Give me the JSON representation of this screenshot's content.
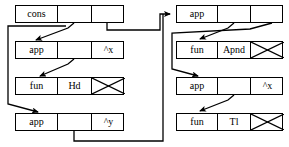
{
  "diagram": {
    "type": "box-and-pointer-graph",
    "background_color": "#ffffff",
    "line_color": "#000000",
    "nodes": [
      {
        "id": "cons-node",
        "name": "cons-node",
        "x": 15,
        "y": 5,
        "width": 109,
        "height": 18,
        "cells": [
          {
            "name": "cons-tag-cell",
            "label": "cons",
            "width": 42,
            "kind": "text"
          },
          {
            "name": "cons-left-pointer-cell",
            "label": "",
            "width": 34,
            "kind": "pointer"
          },
          {
            "name": "cons-right-pointer-cell",
            "label": "",
            "width": 33,
            "kind": "pointer"
          }
        ]
      },
      {
        "id": "app-x-node",
        "name": "app-hd-node",
        "x": 15,
        "y": 41,
        "width": 109,
        "height": 18,
        "cells": [
          {
            "name": "app-tag-cell",
            "label": "app",
            "width": 42,
            "kind": "text"
          },
          {
            "name": "app-function-pointer-cell",
            "label": "",
            "width": 34,
            "kind": "pointer"
          },
          {
            "name": "app-argument-cell",
            "label": "^x",
            "width": 33,
            "kind": "variable"
          }
        ]
      },
      {
        "id": "fun-hd-node",
        "name": "fun-hd-node",
        "x": 15,
        "y": 77,
        "width": 109,
        "height": 18,
        "cells": [
          {
            "name": "fun-tag-cell",
            "label": "fun",
            "width": 42,
            "kind": "text"
          },
          {
            "name": "fun-name-cell",
            "label": "Hd",
            "width": 34,
            "kind": "text"
          },
          {
            "name": "fun-nil-cell",
            "label": "",
            "width": 33,
            "kind": "nil"
          }
        ]
      },
      {
        "id": "app-y-node",
        "name": "app-tl-node",
        "x": 15,
        "y": 113,
        "width": 109,
        "height": 18,
        "cells": [
          {
            "name": "app-tag-cell",
            "label": "app",
            "width": 42,
            "kind": "text"
          },
          {
            "name": "app-function-pointer-cell",
            "label": "",
            "width": 34,
            "kind": "pointer"
          },
          {
            "name": "app-argument-cell",
            "label": "^y",
            "width": 33,
            "kind": "variable"
          }
        ]
      },
      {
        "id": "app-apnd-node",
        "name": "app-apnd-node",
        "x": 176,
        "y": 5,
        "width": 107,
        "height": 18,
        "cells": [
          {
            "name": "app-tag-cell",
            "label": "app",
            "width": 41,
            "kind": "text"
          },
          {
            "name": "app-function-pointer-cell",
            "label": "",
            "width": 33,
            "kind": "pointer"
          },
          {
            "name": "app-argument-pointer-cell",
            "label": "",
            "width": 33,
            "kind": "pointer"
          }
        ]
      },
      {
        "id": "fun-apnd-node",
        "name": "fun-apnd-node",
        "x": 176,
        "y": 41,
        "width": 107,
        "height": 18,
        "cells": [
          {
            "name": "fun-tag-cell",
            "label": "fun",
            "width": 41,
            "kind": "text"
          },
          {
            "name": "fun-name-cell",
            "label": "Apnd",
            "width": 33,
            "kind": "text"
          },
          {
            "name": "fun-nil-cell",
            "label": "",
            "width": 33,
            "kind": "nil"
          }
        ]
      },
      {
        "id": "app-x-right-node",
        "name": "app-tl-right-node",
        "x": 176,
        "y": 77,
        "width": 107,
        "height": 18,
        "cells": [
          {
            "name": "app-tag-cell",
            "label": "app",
            "width": 41,
            "kind": "text"
          },
          {
            "name": "app-function-pointer-cell",
            "label": "",
            "width": 33,
            "kind": "pointer"
          },
          {
            "name": "app-argument-cell",
            "label": "^x",
            "width": 33,
            "kind": "variable"
          }
        ]
      },
      {
        "id": "fun-tl-node",
        "name": "fun-tl-node",
        "x": 176,
        "y": 113,
        "width": 107,
        "height": 18,
        "cells": [
          {
            "name": "fun-tag-cell",
            "label": "fun",
            "width": 41,
            "kind": "text"
          },
          {
            "name": "fun-name-cell",
            "label": "Tl",
            "width": 33,
            "kind": "text"
          },
          {
            "name": "fun-nil-cell",
            "label": "",
            "width": 33,
            "kind": "nil"
          }
        ]
      }
    ],
    "edges": [
      {
        "name": "edge-cons-left-to-app-hd",
        "from": "cons-left-pointer-cell",
        "to": "app-hd-node",
        "style": "diagonal-arrow"
      },
      {
        "name": "edge-cons-right-to-app-apnd",
        "from": "cons-right-pointer-cell",
        "to": "app-apnd-node",
        "style": "orthogonal-arrow"
      },
      {
        "name": "edge-app-hd-to-fun-hd",
        "from": "app-function-pointer-cell",
        "to": "fun-hd-node",
        "style": "diagonal-arrow"
      },
      {
        "name": "edge-cons-left-to-app-tl",
        "from": "cons-left-pointer-cell",
        "to": "app-tl-node",
        "style": "orthogonal-arrow"
      },
      {
        "name": "edge-app-tl-to-app-apnd",
        "from": "app-tl-function-pointer-cell",
        "to": "app-apnd-node",
        "style": "orthogonal-arrow"
      },
      {
        "name": "edge-app-apnd-fn-to-fun-apnd",
        "from": "app-apnd-function-pointer-cell",
        "to": "fun-apnd-node",
        "style": "diagonal-arrow"
      },
      {
        "name": "edge-app-apnd-arg-to-app-tl-right",
        "from": "app-apnd-argument-pointer-cell",
        "to": "app-tl-right-node",
        "style": "orthogonal-arrow"
      },
      {
        "name": "edge-app-tl-right-to-fun-tl",
        "from": "app-tl-right-function-pointer-cell",
        "to": "fun-tl-node",
        "style": "diagonal-arrow"
      }
    ]
  }
}
